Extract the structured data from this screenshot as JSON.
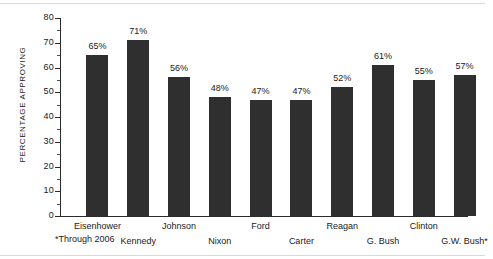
{
  "chart_data": {
    "type": "bar",
    "title": "",
    "subtitle": "",
    "xlabel": "",
    "ylabel": "PERCENTAGE APPROVING",
    "ylim": [
      0,
      80
    ],
    "ytick_step": 10,
    "yticks": [
      "0",
      "10",
      "20",
      "30",
      "40",
      "50",
      "60",
      "70",
      "80"
    ],
    "grid": false,
    "legend": false,
    "bar_color": "#2f2f2f",
    "axis_color": "#2b2b2b",
    "categories": [
      "Eisenhower",
      "Kennedy",
      "Johnson",
      "Nixon",
      "Ford",
      "Carter",
      "Reagan",
      "G. Bush",
      "Clinton",
      "G.W. Bush*"
    ],
    "values": [
      65,
      71,
      56,
      48,
      47,
      47,
      52,
      61,
      55,
      57
    ],
    "data_labels": [
      "65%",
      "71%",
      "56%",
      "48%",
      "47%",
      "47%",
      "52%",
      "61%",
      "55%",
      "57%"
    ],
    "annotations": [
      "*Through 2006"
    ]
  },
  "footnote": "*Through 2006"
}
